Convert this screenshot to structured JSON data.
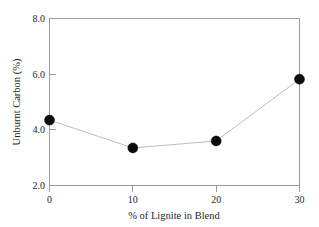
{
  "chart_data": {
    "type": "line",
    "title": "",
    "subtitle": "",
    "xlabel": "% of Lignite in Blend",
    "ylabel": "Unburnt Carbon (%)",
    "x": [
      0,
      10,
      20,
      30
    ],
    "values": [
      4.35,
      3.35,
      3.6,
      5.82
    ],
    "series": [
      {
        "name": "Unburnt Carbon",
        "values": [
          4.35,
          3.35,
          3.6,
          5.82
        ]
      }
    ],
    "xlim": [
      0,
      30
    ],
    "ylim": [
      2.0,
      8.0
    ],
    "xticks": [
      0,
      10,
      20,
      30
    ],
    "yticks": [
      2.0,
      4.0,
      6.0,
      8.0
    ],
    "xtick_labels": [
      "0",
      "10",
      "20",
      "30"
    ],
    "ytick_labels": [
      "2.0",
      "4.0",
      "6.0",
      "8.0"
    ],
    "grid": false,
    "legend": false,
    "legend_position": "none",
    "marker": "filled-circle",
    "marker_color": "#0b0b0b",
    "line_color": "#b5b5b5",
    "frame_color": "#9a9a9a",
    "background_color": "#ffffff"
  }
}
